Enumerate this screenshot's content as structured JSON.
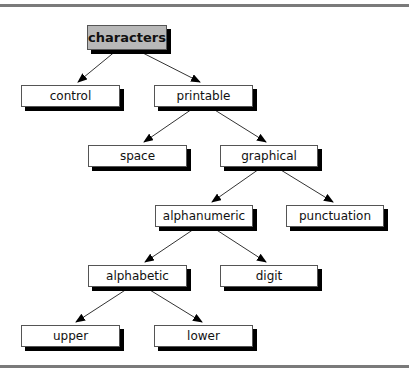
{
  "diagram": {
    "type": "tree",
    "nodes": {
      "characters": {
        "label": "characters"
      },
      "control": {
        "label": "control"
      },
      "printable": {
        "label": "printable"
      },
      "space": {
        "label": "space"
      },
      "graphical": {
        "label": "graphical"
      },
      "alphanumeric": {
        "label": "alphanumeric"
      },
      "punctuation": {
        "label": "punctuation"
      },
      "alphabetic": {
        "label": "alphabetic"
      },
      "digit": {
        "label": "digit"
      },
      "upper": {
        "label": "upper"
      },
      "lower": {
        "label": "lower"
      }
    },
    "edges": [
      [
        "characters",
        "control"
      ],
      [
        "characters",
        "printable"
      ],
      [
        "printable",
        "space"
      ],
      [
        "printable",
        "graphical"
      ],
      [
        "graphical",
        "alphanumeric"
      ],
      [
        "graphical",
        "punctuation"
      ],
      [
        "alphanumeric",
        "alphabetic"
      ],
      [
        "alphanumeric",
        "digit"
      ],
      [
        "alphabetic",
        "upper"
      ],
      [
        "alphabetic",
        "lower"
      ]
    ],
    "colors": {
      "root_fill": "#b8b8b8",
      "node_fill": "#ffffff",
      "shadow": "#000000",
      "rule": "#7a7a7a"
    }
  }
}
